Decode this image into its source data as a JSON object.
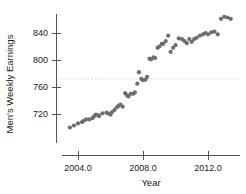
{
  "chart_data": {
    "type": "scatter",
    "title": "",
    "subtitle": "",
    "xlabel": "Year",
    "ylabel": "Men's Weekly Earnings",
    "xlim": [
      2003.2,
      2013.8
    ],
    "ylim": [
      694,
      872
    ],
    "grid": false,
    "legend": null,
    "legend_position": "none",
    "point_color": "#6d6d6d",
    "axis_color": "#555555",
    "text_color": "#1a1a1a",
    "xticks": [
      2004.0,
      2008.0,
      2012.0
    ],
    "xtick_labels": [
      "2004.0",
      "2008.0",
      "2012.0"
    ],
    "yticks": [
      720,
      760,
      800,
      840
    ],
    "ytick_labels": [
      "720",
      "760",
      "800",
      "840"
    ],
    "annotations": [
      {
        "kind": "reference-line",
        "orientation": "horizontal",
        "value": 772,
        "style": "dotted",
        "color": "#9a9a9a"
      }
    ],
    "series": [
      {
        "name": "Men's Weekly Earnings",
        "x": [
          2003.5,
          2003.75,
          2004.0,
          2004.25,
          2004.35,
          2004.5,
          2004.7,
          2004.9,
          2005.0,
          2005.1,
          2005.25,
          2005.3,
          2005.5,
          2005.75,
          2005.85,
          2006.0,
          2006.1,
          2006.25,
          2006.4,
          2006.5,
          2006.6,
          2006.75,
          2006.9,
          2007.0,
          2007.1,
          2007.25,
          2007.4,
          2007.5,
          2007.65,
          2007.75,
          2007.9,
          2008.0,
          2008.15,
          2008.25,
          2008.4,
          2008.5,
          2008.65,
          2008.75,
          2008.9,
          2009.0,
          2009.15,
          2009.25,
          2009.4,
          2009.55,
          2009.7,
          2009.85,
          2010.0,
          2010.2,
          2010.4,
          2010.55,
          2010.7,
          2010.85,
          2011.0,
          2011.15,
          2011.3,
          2011.5,
          2011.7,
          2011.85,
          2012.0,
          2012.2,
          2012.4,
          2012.6,
          2012.8,
          2013.0,
          2013.2,
          2013.4
        ],
        "y": [
          700,
          703,
          706,
          708,
          710,
          712,
          712,
          714,
          717,
          719,
          718,
          717,
          721,
          722,
          721,
          719,
          723,
          726,
          730,
          732,
          734,
          731,
          751,
          748,
          746,
          750,
          750,
          752,
          765,
          782,
          772,
          770,
          771,
          775,
          802,
          801,
          804,
          803,
          818,
          820,
          824,
          824,
          828,
          836,
          812,
          818,
          822,
          832,
          831,
          828,
          825,
          831,
          827,
          831,
          833,
          836,
          838,
          840,
          838,
          841,
          842,
          838,
          861,
          864,
          863,
          861
        ]
      }
    ]
  }
}
